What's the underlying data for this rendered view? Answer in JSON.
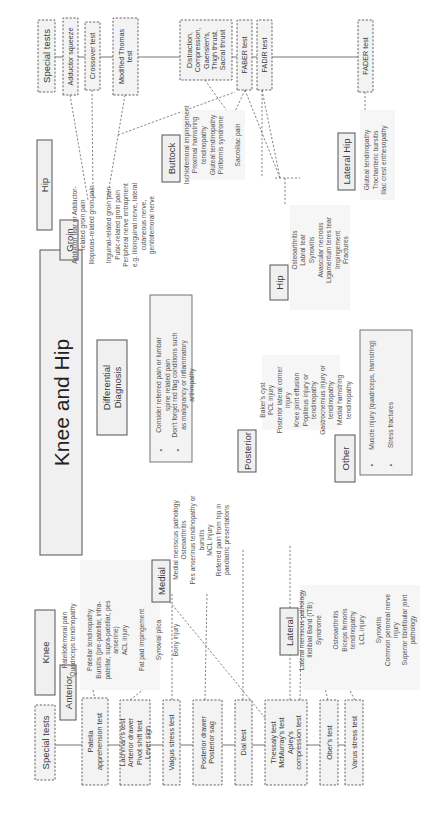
{
  "diagram": {
    "title": "Knee and Hip",
    "differential": {
      "label": [
        "Differential",
        "Diagnosis"
      ],
      "notes": [
        [
          "Consider referred pain or lumbar",
          "spine related pain"
        ],
        [
          "Don't forget red flag conditions such",
          "as malignancy or inflammatory",
          "arthropathy"
        ]
      ]
    },
    "knee": {
      "label": "Knee",
      "special_tests_label": "Special tests",
      "tests": [
        [
          "Patella",
          "apprehension test"
        ],
        [
          "Lachman's test",
          "Anterior drawer",
          "Pivot shift test",
          "Lever sign"
        ],
        [
          "Valgus stress test"
        ],
        [
          "Posterior drawer",
          "Posterior sag"
        ],
        [
          "Dial test"
        ],
        [
          "Thessaly test",
          "McMurray's test",
          "Apley's",
          "compression test"
        ],
        [
          "Ober's test"
        ],
        [
          "Varus stress test"
        ]
      ],
      "anterior": {
        "label": "Anterior",
        "items": [
          "Patellofemoral pain",
          "Quadriceps tendinopathy",
          "",
          "Patellar tendinopathy",
          "Bursitis (pre-patellar, infra-",
          "patellar, supra-patellar, pes",
          "anserine)",
          "ACL injury",
          "",
          "Fat pad impingement",
          "",
          "Synovial plica",
          "",
          "Bony injury"
        ]
      },
      "medial": {
        "label": "Medial",
        "items": [
          "Medial meniscus pathology",
          "Osteoarthritis",
          "Pes anserinus tendinopathy or",
          "bursitis",
          "MCL injury",
          "Referred pain from hip in",
          "paediatric presentations"
        ]
      },
      "posterior": {
        "label": "Posterior",
        "items": [
          "Baker's cyst",
          "PCL injury",
          "Posterior lateral corner",
          "injury",
          "Knee joint effusion",
          "Popliteus injury or",
          "tendinopathy",
          "Gastrocnemius injury or",
          "tendinopathy",
          "Medial hamstring",
          "tendinopathy"
        ]
      },
      "lateral": {
        "label": "Lateral",
        "items": [
          "Lateral meniscus pathology",
          "Iliotibial Band (ITB)",
          "Syndrome",
          "",
          "Osteoarthritis",
          "Biceps femoris",
          "tendinopathy",
          "LCL injury",
          "",
          "Synovitis",
          "Common peroneal nerve",
          "injury",
          "Superior tibiofibular joint",
          "pathology"
        ]
      }
    },
    "hip": {
      "label": "Hip",
      "special_tests_label": "Special tests",
      "tests": [
        [
          "Adductor squeeze"
        ],
        [
          "Crossover test"
        ],
        [
          "Modified Thomas",
          "test"
        ],
        [
          "Distraction,",
          "Compression,",
          "Gaenslen's,",
          "Thigh thrust,",
          "Sacral thrust"
        ],
        [
          "FABER test"
        ],
        [
          "FADIR test"
        ],
        [
          "FADER test"
        ]
      ],
      "groin": {
        "label": "Groin",
        "items": [
          "Adductor tear or Adductor-",
          "related groin pain",
          "Iliopsoas-related groin pain",
          "",
          "Inguinal-related groin pain",
          "Pubic-related groin pain",
          "Peripheral nerve entrapment",
          "e.g. Ilioinguinal nerve, lateral",
          "cutaneous nerve,",
          "genitofemoral nerve"
        ]
      },
      "buttock": {
        "label": "Buttock",
        "items": [
          "Ischiofemoral impingement",
          "Proximal hamstring",
          "tendinopathy",
          "Gluteal tendinopathy",
          "Piriformis syndrome",
          "",
          "Sacroiliac pain"
        ]
      },
      "hip_joint": {
        "label": "Hip",
        "items": [
          "Osteoarthritis",
          "Labral tear",
          "Synovitis",
          "Avascular necrosis",
          "Ligamentum teres tear",
          "Impingement",
          "Fractures"
        ]
      },
      "lateral_hip": {
        "label": "Lateral Hip",
        "items": [
          "Gluteal tendinopathy",
          "Trochanteric bursitis",
          "Iliac crest enthesopathy"
        ]
      }
    },
    "other": {
      "label": "Other",
      "items": [
        "Muscle injury (quadriceps, hamstring)",
        "Stress fractures"
      ]
    }
  }
}
